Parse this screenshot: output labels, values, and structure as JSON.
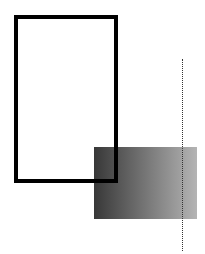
{
  "canvas": {
    "width": 205,
    "height": 254,
    "background": "#ffffff"
  },
  "shapes": {
    "outline_rect": {
      "x": 14,
      "y": 15,
      "width": 104,
      "height": 168,
      "stroke": "#000000",
      "stroke_width": 4,
      "fill": "none"
    },
    "gradient_rect": {
      "x": 94,
      "y": 147,
      "width": 103,
      "height": 72,
      "gradient_from": "#383838",
      "gradient_to": "#b4b4b4",
      "direction": "left-to-right"
    },
    "dotted_line": {
      "x": 182,
      "y1": 59,
      "y2": 251,
      "color": "#333333",
      "style": "dotted",
      "width": 1
    }
  }
}
